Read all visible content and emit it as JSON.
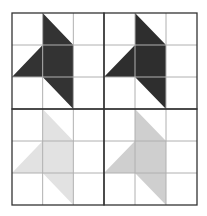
{
  "diagram": {
    "grid": {
      "x0": 12,
      "y0": 13,
      "x1": 197,
      "y1": 205,
      "mid_x": 104,
      "mid_y": 109,
      "cells_per_block": 3
    },
    "colors": {
      "background": "#ffffff",
      "grid_line": "#b0b0b0",
      "block_border": "#333333"
    },
    "blocks": [
      {
        "position": "top-left",
        "fill": "#333333"
      },
      {
        "position": "top-right",
        "fill": "#2e2e2e"
      },
      {
        "position": "bottom-left",
        "fill": "#e2e2e2"
      },
      {
        "position": "bottom-right",
        "fill": "#cfcfcf"
      }
    ],
    "star_shape_cells": [
      [
        1,
        0
      ],
      [
        2,
        1
      ],
      [
        2,
        2
      ],
      [
        3,
        1
      ],
      [
        2,
        2
      ],
      [
        2,
        3
      ],
      [
        1,
        2
      ],
      [
        0,
        2
      ],
      [
        1,
        1
      ]
    ]
  }
}
